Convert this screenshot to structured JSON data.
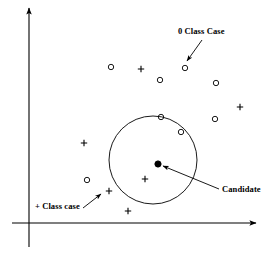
{
  "figure": {
    "title_visible": false,
    "background_color": "#ffffff",
    "stroke_color": "#000000",
    "canvas": {
      "width": 276,
      "height": 256
    }
  },
  "axes": {
    "x_axis": {
      "name": "x-axis",
      "x1": 12,
      "y1": 223,
      "x2": 256,
      "y2": 223,
      "arrow": "right"
    },
    "y_axis": {
      "name": "y-axis",
      "x1": 29,
      "y1": 247,
      "x2": 29,
      "y2": 8,
      "arrow": "up"
    }
  },
  "labels": {
    "zero_class": "0 Class Case",
    "plus_class": "+ Class case",
    "candidate": "Candidate"
  },
  "annotations": [
    {
      "id": "zero-class-arrow",
      "label": "0 Class Case",
      "x1": 202,
      "y1": 40,
      "x2": 187,
      "y2": 61
    },
    {
      "id": "plus-class-arrow",
      "label": "+ Class case",
      "x1": 83,
      "y1": 208,
      "x2": 101,
      "y2": 194
    },
    {
      "id": "candidate-arrow",
      "label": "Candidate",
      "x1": 219,
      "y1": 189,
      "x2": 163,
      "y2": 166
    }
  ],
  "chart_data": {
    "type": "scatter",
    "title": "",
    "xlabel": "",
    "ylabel": "",
    "grid": false,
    "legend": "annotations",
    "axis_arrows": true,
    "xlim": [
      12,
      256
    ],
    "ylim": [
      8,
      223
    ],
    "neighborhood": {
      "name": "candidate-neighborhood-circle",
      "cx": 153,
      "cy": 160,
      "r": 44,
      "fill": "none",
      "stroke": "#000000"
    },
    "series": [
      {
        "name": "0 Class Case",
        "marker": "open-circle",
        "values": [
          [
            111,
            67
          ],
          [
            185,
            68
          ],
          [
            160,
            80
          ],
          [
            216,
            83
          ],
          [
            161,
            117
          ],
          [
            215,
            119
          ],
          [
            181,
            132
          ],
          [
            87,
            180
          ]
        ]
      },
      {
        "name": "+ Class case",
        "marker": "plus",
        "values": [
          [
            141,
            69
          ],
          [
            240,
            107
          ],
          [
            84,
            143
          ],
          [
            145,
            179
          ],
          [
            109,
            191
          ],
          [
            128,
            211
          ]
        ]
      },
      {
        "name": "Candidate",
        "marker": "filled-circle",
        "values": [
          [
            158,
            164
          ]
        ]
      }
    ]
  }
}
